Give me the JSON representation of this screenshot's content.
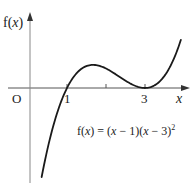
{
  "chart_data": {
    "type": "line",
    "title": "",
    "function": "f(x) = (x − 1)(x − 3)^2",
    "xlabel": "x",
    "ylabel": "f(x)",
    "origin_label": "O",
    "x_tick_labels": [
      "1",
      "3"
    ],
    "x_ticks": [
      1,
      2,
      3
    ],
    "annotations": [
      "f(x) = (x − 1)(x − 3)²"
    ],
    "grid": false,
    "legend": null,
    "key_points": [
      {
        "x": 1,
        "y": 0,
        "label": "root"
      },
      {
        "x": 1.667,
        "y": 1.185,
        "label": "local maximum"
      },
      {
        "x": 3,
        "y": 0,
        "label": "repeated root / local minimum"
      }
    ],
    "series": [
      {
        "name": "f(x)",
        "x": [
          0.35,
          0.5,
          0.75,
          1.0,
          1.25,
          1.5,
          1.667,
          2.0,
          2.25,
          2.5,
          2.75,
          3.0,
          3.25,
          3.5,
          3.75,
          3.92
        ],
        "y": [
          -4.94,
          -3.13,
          -1.27,
          0.0,
          0.76,
          1.13,
          1.19,
          1.0,
          0.7,
          0.38,
          0.11,
          0.0,
          0.14,
          0.63,
          1.55,
          2.46
        ]
      }
    ],
    "xlim": [
      -0.5,
      4.3
    ],
    "ylim": [
      -5.0,
      4.5
    ]
  },
  "labels": {
    "ylabel_prefix": "f(",
    "ylabel_var": "x",
    "ylabel_suffix": ")",
    "origin": "O",
    "tick_1": "1",
    "tick_3": "3",
    "xlabel": "x",
    "formula_prefix": "f(",
    "formula_var": "x",
    "formula_mid": ") = (",
    "formula_var2": "x",
    "formula_mid2": " − 1)(",
    "formula_var3": "x",
    "formula_mid3": " − 3)",
    "formula_exp": "2"
  }
}
